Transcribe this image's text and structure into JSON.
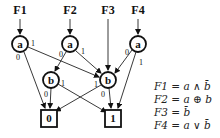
{
  "diagram": {
    "type": "shared-BDD",
    "roots": [
      {
        "label": "F1",
        "x": 20
      },
      {
        "label": "F2",
        "x": 70
      },
      {
        "label": "F3",
        "x": 108
      },
      {
        "label": "F4",
        "x": 138
      }
    ],
    "nodes": [
      {
        "id": "a1",
        "var": "a",
        "x": 20,
        "y": 44
      },
      {
        "id": "a2",
        "var": "a",
        "x": 70,
        "y": 44
      },
      {
        "id": "a4",
        "var": "a",
        "x": 138,
        "y": 44
      },
      {
        "id": "bL",
        "var": "b",
        "x": 51,
        "y": 80
      },
      {
        "id": "bR",
        "var": "b",
        "x": 108,
        "y": 80
      }
    ],
    "terminals": [
      {
        "id": "t0",
        "label": "0",
        "x": 49,
        "y": 118
      },
      {
        "id": "t1",
        "label": "1",
        "x": 113,
        "y": 118
      }
    ],
    "edge_labels": {
      "a1_0": "0",
      "a1_1": "1",
      "a2_0": "0",
      "a2_1": "1",
      "a4_0": "0",
      "a4_1": "1",
      "bL_0": "0",
      "bL_1": "1",
      "bR_0": "0",
      "bR_1": "1"
    },
    "equations": [
      "F1 = a ∧ b̄",
      "F2 = a ⊕ b",
      "F3 = b̄",
      "F4 = a ∨ b̄"
    ]
  }
}
